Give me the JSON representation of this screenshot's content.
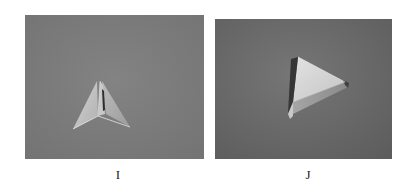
{
  "figure": {
    "panels": [
      {
        "id": "I",
        "label": "I",
        "subject": "paper pyramid folded, upright tip, viewed from front",
        "background_color": "#7c7c7c",
        "object_colors": {
          "light": "#d8d8d8",
          "mid": "#b4b4b4",
          "shadow": "#3a3a3a"
        }
      },
      {
        "id": "J",
        "label": "J",
        "subject": "paper tetrahedron resting on side, triangular face forward",
        "background_color": "#6c6c6c",
        "object_colors": {
          "light": "#dcdcdc",
          "mid": "#a8a8a8",
          "shadow": "#2e2e2e"
        }
      }
    ]
  }
}
